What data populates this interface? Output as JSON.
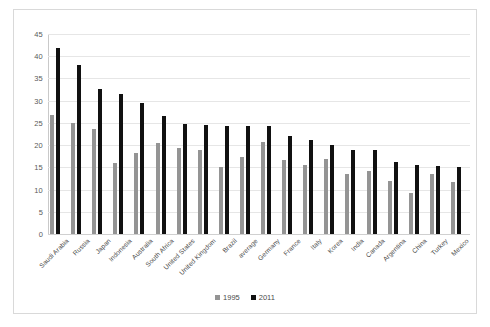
{
  "chart_data": {
    "type": "bar",
    "title": "",
    "subtitle": "",
    "xlabel": "",
    "ylabel": "",
    "ylim": [
      0,
      45
    ],
    "ytick_step": 5,
    "yticks": [
      45,
      40,
      35,
      30,
      25,
      20,
      15,
      10,
      5,
      0
    ],
    "grid": true,
    "legend_position": "bottom-center",
    "categories": [
      "Saudi Arabia",
      "Russia",
      "Japan",
      "Indonesia",
      "Australia",
      "South Africa",
      "United States",
      "United Kingdom",
      "Brazil",
      "average",
      "Germany",
      "France",
      "Italy",
      "Korea",
      "India",
      "Canada",
      "Argentina",
      "China",
      "Turkey",
      "Mexico"
    ],
    "series": [
      {
        "name": "1995",
        "color": "#949494",
        "values": [
          26.8,
          25.0,
          23.6,
          16.0,
          18.3,
          20.4,
          19.4,
          18.9,
          15.1,
          17.4,
          20.6,
          16.6,
          15.5,
          16.9,
          13.6,
          14.2,
          12.0,
          9.3,
          13.6,
          11.7
        ]
      },
      {
        "name": "2011",
        "color": "#111111",
        "values": [
          41.8,
          38.0,
          32.7,
          31.5,
          29.4,
          26.5,
          24.7,
          24.5,
          24.4,
          24.4,
          24.3,
          22.0,
          21.2,
          20.0,
          19.0,
          18.9,
          16.2,
          15.5,
          15.3,
          15.1
        ]
      }
    ]
  },
  "legend": {
    "items": [
      {
        "label": "1995",
        "color": "#949494"
      },
      {
        "label": "2011",
        "color": "#111111"
      }
    ]
  }
}
